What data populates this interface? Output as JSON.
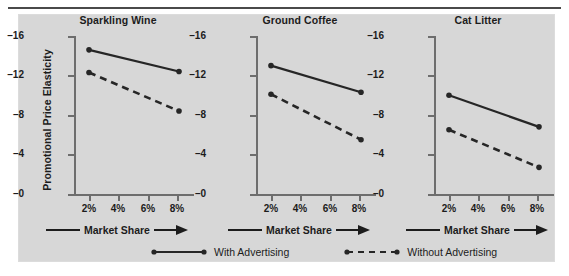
{
  "chart_data": {
    "type": "line",
    "title": "",
    "panels": [
      {
        "title": "Sparkling Wine",
        "x": [
          2,
          8
        ],
        "series": [
          {
            "name": "With Advertising",
            "style": "solid",
            "values": [
              -14.6,
              -12.4
            ]
          },
          {
            "name": "Without Advertising",
            "style": "dashed",
            "values": [
              -12.3,
              -8.4
            ]
          }
        ]
      },
      {
        "title": "Ground Coffee",
        "x": [
          2,
          8
        ],
        "series": [
          {
            "name": "With Advertising",
            "style": "solid",
            "values": [
              -13.0,
              -10.3
            ]
          },
          {
            "name": "Without Advertising",
            "style": "dashed",
            "values": [
              -10.1,
              -5.5
            ]
          }
        ]
      },
      {
        "title": "Cat Litter",
        "x": [
          2,
          8
        ],
        "series": [
          {
            "name": "With Advertising",
            "style": "solid",
            "values": [
              -10.0,
              -6.8
            ]
          },
          {
            "name": "Without Advertising",
            "style": "dashed",
            "values": [
              -6.5,
              -2.7
            ]
          }
        ]
      }
    ],
    "ylabel": "Promotional Price Elasticity",
    "ylim": [
      -16,
      0
    ],
    "yticks": [
      -16,
      -12,
      -8,
      -4,
      0
    ],
    "ytick_labels": [
      "–16",
      "–12",
      "–8",
      "–4",
      "–0"
    ],
    "xlabel": "Market Share",
    "xlim": [
      1,
      9
    ],
    "xticks": [
      2,
      4,
      6,
      8
    ],
    "xtick_labels": [
      "2%",
      "4%",
      "6%",
      "8%"
    ],
    "grid": false,
    "legend_position": "bottom",
    "legend": [
      {
        "name": "With Advertising",
        "style": "solid"
      },
      {
        "name": "Without Advertising",
        "style": "dashed"
      }
    ]
  },
  "axis": {
    "x_arrow_icon": "arrow-right-icon"
  },
  "colors": {
    "plate_background": "#d7d7d7",
    "page_background": "#ffffff",
    "ink": "#1c1c1c",
    "axis": "#6d6d6d",
    "series": "#262626"
  }
}
